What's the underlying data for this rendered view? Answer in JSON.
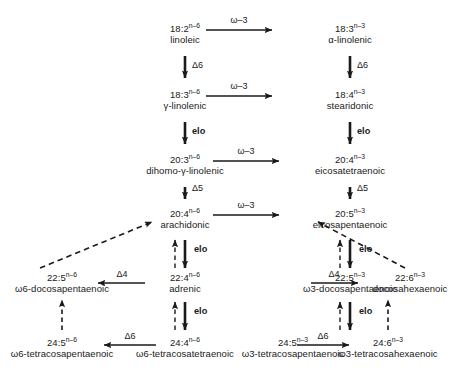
{
  "diagram": {
    "enzyme_labels": {
      "delta6": "Δ6",
      "delta5": "Δ5",
      "delta4": "Δ4",
      "elongase": "elo",
      "omega3_desaturase": "ω–3"
    },
    "nodes": {
      "n6_18_2": {
        "formula": "18:2",
        "superscript": "n–6",
        "common": "linoleic"
      },
      "n3_18_3": {
        "formula": "18:3",
        "superscript": "n–3",
        "common": "α-linolenic"
      },
      "n6_18_3": {
        "formula": "18:3",
        "superscript": "n–6",
        "common": "γ-linolenic"
      },
      "n3_18_4": {
        "formula": "18:4",
        "superscript": "n–3",
        "common": "stearidonic"
      },
      "n6_20_3": {
        "formula": "20:3",
        "superscript": "n–6",
        "common": "dihomo-γ-linolenic"
      },
      "n3_20_4": {
        "formula": "20:4",
        "superscript": "n–3",
        "common": "eicosatetraenoic"
      },
      "n6_20_4": {
        "formula": "20:4",
        "superscript": "n–6",
        "common": "arachidonic"
      },
      "n3_20_5": {
        "formula": "20:5",
        "superscript": "n–3",
        "common": "eicosapentaenoic"
      },
      "n6_22_5": {
        "formula": "22:5",
        "superscript": "n–6",
        "common": "ω6-docosapentaenoic"
      },
      "n6_22_4": {
        "formula": "22:4",
        "superscript": "n–6",
        "common": "adrenic"
      },
      "n3_22_5": {
        "formula": "22:5",
        "superscript": "n–3",
        "common": "ω3-docosapentaenoic"
      },
      "n3_22_6": {
        "formula": "22:6",
        "superscript": "n–3",
        "common": "docosahexaenoic"
      },
      "n6_24_5": {
        "formula": "24:5",
        "superscript": "n–6",
        "common": "ω6-tetracosapentaenoic"
      },
      "n6_24_4": {
        "formula": "24:4",
        "superscript": "n–6",
        "common": "ω6-tetracosatetraenoic"
      },
      "n3_24_5": {
        "formula": "24:5",
        "superscript": "n–3",
        "common": "ω3-tetracosapentaenoic"
      },
      "n3_24_6": {
        "formula": "24:6",
        "superscript": "n–3",
        "common": "ω3-tetracosahexaenoic"
      }
    },
    "edge_labels": {
      "omega3_row1": "ω–3",
      "omega3_row2": "ω–3",
      "omega3_row3": "ω–3",
      "omega3_row4": "ω–3",
      "n6_d6_18": "Δ6",
      "n3_d6_18": "Δ6",
      "n6_elo_18": "elo",
      "n3_elo_18": "elo",
      "n6_d5_20": "Δ5",
      "n3_d5_20": "Δ5",
      "n6_elo_20": "elo",
      "n3_elo_20": "elo",
      "n6_d4_22": "Δ4",
      "n3_d4_22": "Δ4",
      "n6_elo_22": "elo",
      "n3_elo_22": "elo",
      "n6_d6_24": "Δ6",
      "n3_d6_24": "Δ6"
    },
    "colors": {
      "stroke": "#1a1a1a",
      "background": "#ffffff"
    }
  }
}
